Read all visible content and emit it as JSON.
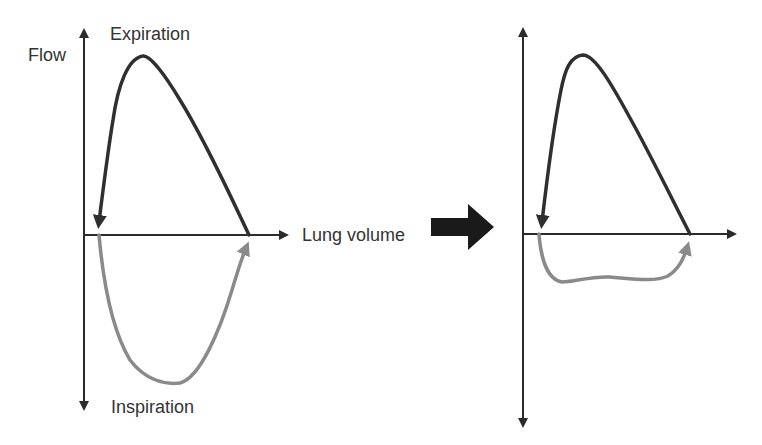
{
  "diagram": {
    "colors": {
      "axis": "#2b2b2b",
      "expiration_curve": "#2f2f2f",
      "inspiration_curve": "#8a8a8a",
      "transition_arrow": "#1a1a1a",
      "text": "#333333"
    },
    "left_panel": {
      "y_axis_label": "Flow",
      "x_axis_label": "Lung volume",
      "top_label": "Expiration",
      "bottom_label": "Inspiration",
      "expiration_limb": "dark curve rising steeply to a peak then descending linearly; arrow points back to origin side",
      "inspiration_limb": "grey U-shaped curve below axis with arrow returning to right intercept"
    },
    "transition_arrow": {
      "icon": "right-block-arrow"
    },
    "right_panel": {
      "expiration_limb": "dark curve, same shape as left panel",
      "inspiration_limb": "grey flattened (plateaued) curve just below axis"
    }
  }
}
